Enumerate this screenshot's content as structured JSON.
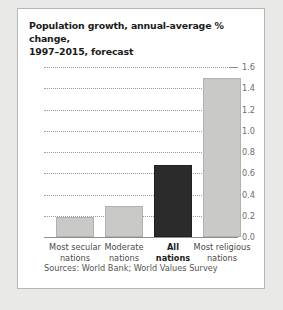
{
  "card": {
    "title": "Population growth, annual-average % change, 1997–2015, forecast",
    "title_line1": "Population growth, annual-average % change,",
    "title_line2": "1997–2015, forecast",
    "source": "Sources: World Bank; World Values Survey"
  },
  "chart_data": {
    "type": "bar",
    "title": "Population growth, annual-average % change, 1997–2015, forecast",
    "xlabel": "",
    "ylabel": "",
    "categories": [
      "Most secular nations",
      "Moderate nations",
      "All nations",
      "Most religious nations"
    ],
    "category_lines": [
      [
        "Most secular",
        "nations"
      ],
      [
        "Moderate",
        "nations"
      ],
      [
        "All",
        "nations"
      ],
      [
        "Most religious",
        "nations"
      ]
    ],
    "values": [
      0.19,
      0.29,
      0.68,
      1.5
    ],
    "ylim": [
      0.0,
      1.6
    ],
    "ytick_step": 0.2,
    "yticks": [
      "0.0",
      "0.2",
      "0.4",
      "0.6",
      "0.8",
      "1.0",
      "1.2",
      "1.4",
      "1.6"
    ],
    "ytick_values": [
      0.0,
      0.2,
      0.4,
      0.6,
      0.8,
      1.0,
      1.2,
      1.4,
      1.6
    ],
    "grid": true,
    "axis_position": "right",
    "legend": "none",
    "highlight_index": 2,
    "colors": {
      "bar": "#c9c9c7",
      "bar_border": "#b0b0ae",
      "bar_highlight": "#2b2b2b",
      "bar_highlight_border": "#202020",
      "grid": "#9b9b99",
      "axis": "#8e8e8c",
      "text": "#1b1b1b",
      "tick_text": "#6f6f6d",
      "card_background": "#ffffff",
      "page_background": "#e9e9e7"
    }
  }
}
